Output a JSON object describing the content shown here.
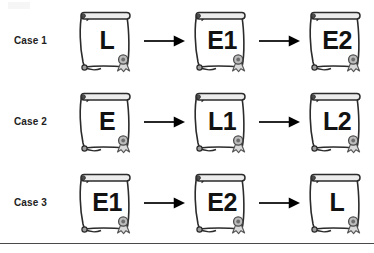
{
  "figure": {
    "type": "diagram",
    "subtype": "flow-sequence",
    "colors": {
      "background": "#ffffff",
      "ink": "#1a1a1a",
      "label_text": "#222222",
      "doc_text": "#121212",
      "scroll_fill": "#ffffff",
      "scroll_stroke": "#2b2b2b",
      "roll_fill": "#e8e8e8",
      "knob_fill": "#4d4d4d",
      "seal_fill": "#bdbdbd",
      "seal_stroke": "#555555",
      "ribbon_fill": "#d9d9d9",
      "arrow": "#000000",
      "rule": "#4a4a4a"
    },
    "rows": [
      {
        "label": "Case 1",
        "documents": [
          {
            "text": "L",
            "icon": "certificate-scroll-icon"
          },
          {
            "text": "E1",
            "icon": "certificate-scroll-icon"
          },
          {
            "text": "E2",
            "icon": "certificate-scroll-icon"
          }
        ],
        "connectors": [
          {
            "icon": "arrow-right-icon"
          },
          {
            "icon": "arrow-right-icon"
          }
        ]
      },
      {
        "label": "Case 2",
        "documents": [
          {
            "text": "E",
            "icon": "certificate-scroll-icon"
          },
          {
            "text": "L1",
            "icon": "certificate-scroll-icon"
          },
          {
            "text": "L2",
            "icon": "certificate-scroll-icon"
          }
        ],
        "connectors": [
          {
            "icon": "arrow-right-icon"
          },
          {
            "icon": "arrow-right-icon"
          }
        ]
      },
      {
        "label": "Case 3",
        "documents": [
          {
            "text": "E1",
            "icon": "certificate-scroll-icon"
          },
          {
            "text": "E2",
            "icon": "certificate-scroll-icon"
          },
          {
            "text": "L",
            "icon": "certificate-scroll-icon"
          }
        ],
        "connectors": [
          {
            "icon": "arrow-right-icon"
          },
          {
            "icon": "arrow-right-icon"
          }
        ]
      }
    ],
    "footer_rule": true
  }
}
